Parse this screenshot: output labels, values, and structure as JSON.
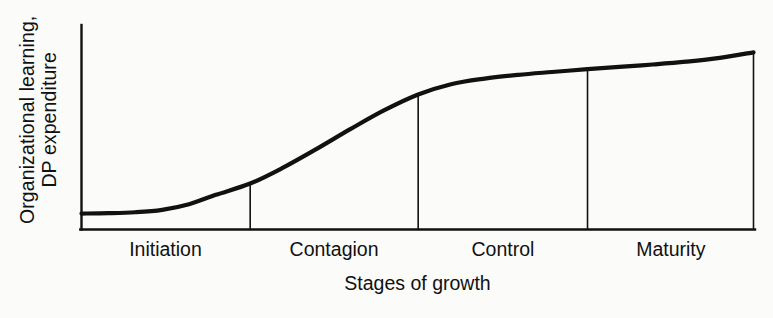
{
  "chart_data": {
    "type": "line",
    "title": "",
    "subtitle": "",
    "xlabel": "Stages of growth",
    "ylabel": "Organizational learning, DP expenditure",
    "ylabel_lines": [
      "Organizational learning,",
      "DP expenditure"
    ],
    "categories": [
      "Initiation",
      "Contagion",
      "Control",
      "Maturity"
    ],
    "grid": false,
    "legend": "none",
    "axis_color": "#111111",
    "curve_color": "#111111",
    "background_color": "#fbfbfa",
    "xlim": [
      0,
      100
    ],
    "ylim": [
      0,
      100
    ],
    "axis_ticks": "none",
    "annotation": "S-shaped growth curve divided into four stages by vertical dividers dropped from the curve to the x-axis",
    "stage_boundaries_pct": [
      0,
      25.1,
      50.1,
      75.3,
      100
    ],
    "series": [
      {
        "name": "Organizational learning / DP expenditure",
        "x": [
          0,
          4,
          8,
          12,
          16,
          20,
          25.1,
          30,
          35,
          40,
          45,
          50.1,
          55,
          60,
          65,
          70,
          75.3,
          80,
          85,
          90,
          95,
          100
        ],
        "y": [
          8.5,
          8.7,
          9.2,
          10.5,
          13.5,
          18.5,
          24.5,
          33.0,
          43.0,
          53.5,
          63.5,
          72.0,
          77.5,
          80.5,
          82.5,
          84.0,
          85.5,
          86.7,
          88.0,
          89.5,
          91.5,
          94.5
        ]
      }
    ],
    "dividers": [
      {
        "label": "Initiation/Contagion",
        "x_pct": 25.1,
        "y_top_pct": 24.5
      },
      {
        "label": "Contagion/Control",
        "x_pct": 50.1,
        "y_top_pct": 72.0
      },
      {
        "label": "Control/Maturity",
        "x_pct": 75.3,
        "y_top_pct": 85.5
      },
      {
        "label": "right-edge",
        "x_pct": 100,
        "y_top_pct": 94.5
      }
    ]
  },
  "axes": {
    "x_title": "Stages of growth",
    "y_title_line1": "Organizational learning,",
    "y_title_line2": "DP expenditure"
  },
  "stages": [
    {
      "label": "Initiation"
    },
    {
      "label": "Contagion"
    },
    {
      "label": "Control"
    },
    {
      "label": "Maturity"
    }
  ]
}
